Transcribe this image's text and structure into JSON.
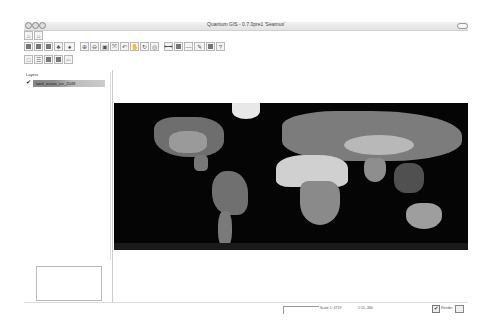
{
  "window": {
    "title": "Quantum GIS - 0.7.0pre1 'Seamus'",
    "title_icon": "qgis-icon"
  },
  "toolbars": {
    "row1": [
      {
        "name": "capture-point-icon",
        "glyph": "⌂"
      },
      {
        "name": "capture-line-icon",
        "glyph": "⌂"
      }
    ],
    "row2": [
      {
        "name": "new-project-icon",
        "glyph": "▤"
      },
      {
        "name": "open-project-icon",
        "glyph": "▥"
      },
      {
        "name": "save-project-icon",
        "glyph": "▦"
      },
      {
        "name": "add-vector-layer-icon",
        "glyph": "♣"
      },
      {
        "name": "add-raster-layer-icon",
        "glyph": "♠"
      },
      {
        "name": "zoom-in-icon",
        "glyph": "⊕"
      },
      {
        "name": "zoom-out-icon",
        "glyph": "⊖"
      },
      {
        "name": "zoom-full-icon",
        "glyph": "▣"
      },
      {
        "name": "zoom-layer-icon",
        "glyph": "⤧"
      },
      {
        "name": "zoom-last-icon",
        "glyph": "↶"
      },
      {
        "name": "pan-icon",
        "glyph": "✋"
      },
      {
        "name": "refresh-icon",
        "glyph": "↻"
      },
      {
        "name": "identify-icon",
        "glyph": "◎"
      },
      {
        "name": "measure-icon",
        "glyph": "⟷"
      },
      {
        "name": "attribute-table-icon",
        "glyph": "▦"
      },
      {
        "name": "line-icon",
        "glyph": "—"
      },
      {
        "name": "digitize-icon",
        "glyph": "✎"
      },
      {
        "name": "map-composer-icon",
        "glyph": "▮"
      },
      {
        "name": "help-icon",
        "glyph": "?"
      }
    ],
    "row3": [
      {
        "name": "layer-new-icon",
        "glyph": "□"
      },
      {
        "name": "layer-list-icon",
        "glyph": "☰"
      },
      {
        "name": "layer-show-icon",
        "glyph": "▣"
      },
      {
        "name": "layer-hide-icon",
        "glyph": "▢"
      },
      {
        "name": "layer-overview-icon",
        "glyph": "⌓"
      }
    ]
  },
  "layers_panel": {
    "title": "Layers",
    "items": [
      {
        "name": "land_ocean_ice_2048",
        "checked": true
      }
    ]
  },
  "status_bar": {
    "scale": "Scale 1: 4719",
    "coordinates": "1:15,-360",
    "render_label": "Render",
    "render_checked": true,
    "check_glyph": "✔"
  },
  "colors": {
    "map_background": "#050505",
    "land": "#8a8a8a",
    "toolbar_bg": "#f4f4f4"
  }
}
